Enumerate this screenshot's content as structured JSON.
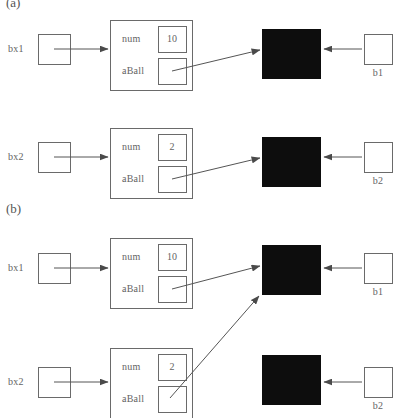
{
  "figure": {
    "background": "#ffffff",
    "stroke_color": "#6a6a6a",
    "text_color": "#636363",
    "solid_fill": "#0d0d0d"
  },
  "panels": [
    {
      "id": "panel-a",
      "label": "(a)",
      "label_x": 6,
      "label_y": -4,
      "clipped_at_top": true,
      "rows": [
        {
          "id": "row-a1",
          "variable_label": "bx1",
          "variable_box": {
            "x": 38,
            "y": 34,
            "w": 32,
            "h": 30
          },
          "container_box": {
            "x": 110,
            "y": 20,
            "w": 82,
            "h": 70
          },
          "fields": [
            {
              "name": "num",
              "value": "10",
              "value_box": {
                "x": 158,
                "y": 26,
                "w": 28,
                "h": 26
              }
            },
            {
              "name": "aBall",
              "value": "",
              "value_box": {
                "x": 158,
                "y": 58,
                "w": 28,
                "h": 26
              }
            }
          ],
          "object_square": {
            "x": 262,
            "y": 29,
            "w": 58,
            "h": 49
          },
          "object_label": "b1",
          "object_ref_box": {
            "x": 364,
            "y": 34,
            "w": 28,
            "h": 30
          }
        },
        {
          "id": "row-a2",
          "variable_label": "bx2",
          "variable_box": {
            "x": 38,
            "y": 142,
            "w": 32,
            "h": 30
          },
          "container_box": {
            "x": 110,
            "y": 128,
            "w": 82,
            "h": 70
          },
          "fields": [
            {
              "name": "num",
              "value": "2",
              "value_box": {
                "x": 158,
                "y": 134,
                "w": 28,
                "h": 26
              }
            },
            {
              "name": "aBall",
              "value": "",
              "value_box": {
                "x": 158,
                "y": 166,
                "w": 28,
                "h": 26
              }
            }
          ],
          "object_square": {
            "x": 262,
            "y": 137,
            "w": 58,
            "h": 49
          },
          "object_label": "b2",
          "object_ref_box": {
            "x": 364,
            "y": 142,
            "w": 28,
            "h": 30
          }
        }
      ]
    },
    {
      "id": "panel-b",
      "label": "(b)",
      "label_x": 6,
      "label_y": 202,
      "clipped_at_top": false,
      "rows": [
        {
          "id": "row-b1",
          "variable_label": "bx1",
          "variable_box": {
            "x": 38,
            "y": 253,
            "w": 32,
            "h": 30
          },
          "container_box": {
            "x": 110,
            "y": 238,
            "w": 82,
            "h": 70
          },
          "fields": [
            {
              "name": "num",
              "value": "10",
              "value_box": {
                "x": 158,
                "y": 244,
                "w": 28,
                "h": 26
              }
            },
            {
              "name": "aBall",
              "value": "",
              "value_box": {
                "x": 158,
                "y": 276,
                "w": 28,
                "h": 26
              }
            }
          ],
          "object_square": {
            "x": 262,
            "y": 245,
            "w": 58,
            "h": 49
          },
          "object_label": "b1",
          "object_ref_box": {
            "x": 364,
            "y": 253,
            "w": 28,
            "h": 30
          }
        },
        {
          "id": "row-b2",
          "variable_label": "bx2",
          "variable_box": {
            "x": 38,
            "y": 367,
            "w": 32,
            "h": 30
          },
          "container_box": {
            "x": 110,
            "y": 348,
            "w": 82,
            "h": 70
          },
          "fields": [
            {
              "name": "num",
              "value": "2",
              "value_box": {
                "x": 158,
                "y": 354,
                "w": 28,
                "h": 26
              }
            },
            {
              "name": "aBall",
              "value": "",
              "value_box": {
                "x": 158,
                "y": 386,
                "w": 28,
                "h": 26
              }
            }
          ],
          "object_square": {
            "x": 262,
            "y": 355,
            "w": 58,
            "h": 49
          },
          "object_label": "b2",
          "object_ref_box": {
            "x": 364,
            "y": 367,
            "w": 28,
            "h": 30
          }
        }
      ]
    }
  ],
  "arrows": [
    {
      "id": "arrow-a1-var",
      "from": [
        54,
        49
      ],
      "to": [
        108,
        49
      ]
    },
    {
      "id": "arrow-a1-aball",
      "from": [
        172,
        71
      ],
      "to": [
        260,
        50
      ]
    },
    {
      "id": "arrow-a1-b1",
      "from": [
        362,
        49
      ],
      "to": [
        324,
        49
      ]
    },
    {
      "id": "arrow-a2-var",
      "from": [
        54,
        157
      ],
      "to": [
        108,
        157
      ]
    },
    {
      "id": "arrow-a2-aball",
      "from": [
        172,
        179
      ],
      "to": [
        260,
        158
      ]
    },
    {
      "id": "arrow-a2-b2",
      "from": [
        362,
        157
      ],
      "to": [
        324,
        157
      ]
    },
    {
      "id": "arrow-b1-var",
      "from": [
        54,
        268
      ],
      "to": [
        108,
        268
      ]
    },
    {
      "id": "arrow-b1-aball",
      "from": [
        172,
        289
      ],
      "to": [
        260,
        266
      ]
    },
    {
      "id": "arrow-b1-b1",
      "from": [
        362,
        268
      ],
      "to": [
        324,
        268
      ]
    },
    {
      "id": "arrow-b2-var",
      "from": [
        54,
        382
      ],
      "to": [
        108,
        382
      ]
    },
    {
      "id": "arrow-b2-aball-crossing",
      "from": [
        170,
        398
      ],
      "to": [
        259,
        296
      ]
    },
    {
      "id": "arrow-b2-b2",
      "from": [
        362,
        382
      ],
      "to": [
        324,
        382
      ]
    }
  ]
}
